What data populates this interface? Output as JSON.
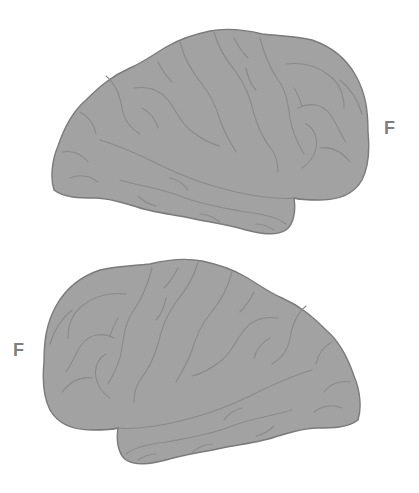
{
  "figure": {
    "colors": {
      "background": "#ffffff",
      "brain_fill": "#a2a2a2",
      "brain_outline": "#7a7a7a",
      "sulcus": "#8a8a8a",
      "label": "#7f7f7f"
    },
    "panels": [
      {
        "name": "top-brain",
        "view": "lateral, frontal lobe on right",
        "label": "F",
        "label_side": "right"
      },
      {
        "name": "bottom-brain",
        "view": "lateral, frontal lobe on left",
        "label": "F",
        "label_side": "left"
      }
    ]
  }
}
